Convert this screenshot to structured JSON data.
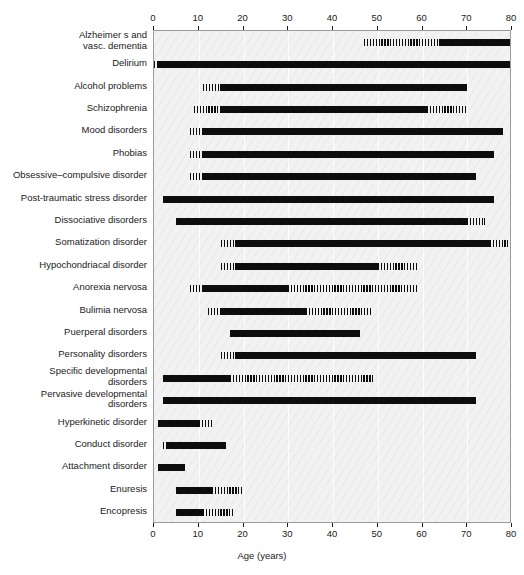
{
  "chart_data": {
    "type": "bar",
    "title": "",
    "xlabel": "Age (years)",
    "ylabel": "",
    "xlim": [
      0,
      80
    ],
    "xticks": [
      0,
      10,
      20,
      30,
      40,
      50,
      60,
      70,
      80
    ],
    "xticklabels": [
      "0",
      "10",
      "20",
      "30",
      "40",
      "50",
      "60",
      "70",
      "80"
    ],
    "grid": true,
    "legend": "none",
    "orientation": "horizontal",
    "note": "Each row shows an age range; solid black = peak/typical onset period, hatched (striped) = less typical onset period.",
    "categories": [
      "Alzheimer s and\nvasc. dementia",
      "Delirium",
      "Alcohol problems",
      "Schizophrenia",
      "Mood disorders",
      "Phobias",
      "Obsessive–compulsive disorder",
      "Post-traumatic stress disorder",
      "Dissociative disorders",
      "Somatization disorder",
      "Hypochondriacal disorder",
      "Anorexia nervosa",
      "Bulimia nervosa",
      "Puerperal disorders",
      "Personality disorders",
      "Specific developmental\ndisorders",
      "Pervasive developmental\ndisorders",
      "Hyperkinetic disorder",
      "Conduct disorder",
      "Attachment disorder",
      "Enuresis",
      "Encopresis"
    ],
    "rows": [
      {
        "label": "Alzheimer s and\nvasc. dementia",
        "two_line": true,
        "segments": [
          {
            "start": 47,
            "end": 64,
            "style": "hatch"
          },
          {
            "start": 64,
            "end": 80,
            "style": "solid"
          }
        ]
      },
      {
        "label": "Delirium",
        "two_line": false,
        "segments": [
          {
            "start": 0,
            "end": 1,
            "style": "hatch"
          },
          {
            "start": 1,
            "end": 80,
            "style": "solid"
          }
        ]
      },
      {
        "label": "Alcohol problems",
        "two_line": false,
        "segments": [
          {
            "start": 11,
            "end": 15,
            "style": "hatch"
          },
          {
            "start": 15,
            "end": 70,
            "style": "solid"
          }
        ]
      },
      {
        "label": "Schizophrenia",
        "two_line": false,
        "segments": [
          {
            "start": 9,
            "end": 15,
            "style": "hatch"
          },
          {
            "start": 15,
            "end": 61,
            "style": "solid"
          },
          {
            "start": 61,
            "end": 70,
            "style": "hatch"
          }
        ]
      },
      {
        "label": "Mood disorders",
        "two_line": false,
        "segments": [
          {
            "start": 8,
            "end": 11,
            "style": "hatch"
          },
          {
            "start": 11,
            "end": 78,
            "style": "solid"
          }
        ]
      },
      {
        "label": "Phobias",
        "two_line": false,
        "segments": [
          {
            "start": 8,
            "end": 11,
            "style": "hatch"
          },
          {
            "start": 11,
            "end": 76,
            "style": "solid"
          }
        ]
      },
      {
        "label": "Obsessive–compulsive disorder",
        "two_line": false,
        "segments": [
          {
            "start": 8,
            "end": 11,
            "style": "hatch"
          },
          {
            "start": 11,
            "end": 72,
            "style": "solid"
          }
        ]
      },
      {
        "label": "Post-traumatic stress disorder",
        "two_line": false,
        "segments": [
          {
            "start": 2,
            "end": 76,
            "style": "solid"
          }
        ]
      },
      {
        "label": "Dissociative disorders",
        "two_line": false,
        "segments": [
          {
            "start": 5,
            "end": 70,
            "style": "solid"
          },
          {
            "start": 70,
            "end": 74,
            "style": "hatch"
          }
        ]
      },
      {
        "label": "Somatization disorder",
        "two_line": false,
        "segments": [
          {
            "start": 15,
            "end": 18,
            "style": "hatch"
          },
          {
            "start": 18,
            "end": 75,
            "style": "solid"
          },
          {
            "start": 75,
            "end": 79,
            "style": "hatch"
          }
        ]
      },
      {
        "label": "Hypochondriacal disorder",
        "two_line": false,
        "segments": [
          {
            "start": 15,
            "end": 18,
            "style": "hatch"
          },
          {
            "start": 18,
            "end": 50,
            "style": "solid"
          },
          {
            "start": 50,
            "end": 59,
            "style": "hatch"
          }
        ]
      },
      {
        "label": "Anorexia nervosa",
        "two_line": false,
        "segments": [
          {
            "start": 8,
            "end": 11,
            "style": "hatch"
          },
          {
            "start": 11,
            "end": 30,
            "style": "solid"
          },
          {
            "start": 30,
            "end": 59,
            "style": "hatch"
          }
        ]
      },
      {
        "label": "Bulimia nervosa",
        "two_line": false,
        "segments": [
          {
            "start": 12,
            "end": 15,
            "style": "hatch"
          },
          {
            "start": 15,
            "end": 34,
            "style": "solid"
          },
          {
            "start": 34,
            "end": 49,
            "style": "hatch"
          }
        ]
      },
      {
        "label": "Puerperal disorders",
        "two_line": false,
        "segments": [
          {
            "start": 17,
            "end": 46,
            "style": "solid"
          }
        ]
      },
      {
        "label": "Personality disorders",
        "two_line": false,
        "segments": [
          {
            "start": 15,
            "end": 18,
            "style": "hatch"
          },
          {
            "start": 18,
            "end": 72,
            "style": "solid"
          }
        ]
      },
      {
        "label": "Specific developmental\ndisorders",
        "two_line": true,
        "segments": [
          {
            "start": 2,
            "end": 17,
            "style": "solid"
          },
          {
            "start": 17,
            "end": 49,
            "style": "hatch"
          }
        ]
      },
      {
        "label": "Pervasive developmental\ndisorders",
        "two_line": true,
        "segments": [
          {
            "start": 2,
            "end": 72,
            "style": "solid"
          }
        ]
      },
      {
        "label": "Hyperkinetic disorder",
        "two_line": false,
        "segments": [
          {
            "start": 1,
            "end": 10,
            "style": "solid"
          },
          {
            "start": 10,
            "end": 13,
            "style": "hatch"
          }
        ]
      },
      {
        "label": "Conduct disorder",
        "two_line": false,
        "segments": [
          {
            "start": 2,
            "end": 3,
            "style": "hatch"
          },
          {
            "start": 3,
            "end": 16,
            "style": "solid"
          }
        ]
      },
      {
        "label": "Attachment disorder",
        "two_line": false,
        "segments": [
          {
            "start": 1,
            "end": 7,
            "style": "solid"
          }
        ]
      },
      {
        "label": "Enuresis",
        "two_line": false,
        "segments": [
          {
            "start": 5,
            "end": 13,
            "style": "solid"
          },
          {
            "start": 13,
            "end": 20,
            "style": "hatch"
          }
        ]
      },
      {
        "label": "Encopresis",
        "two_line": false,
        "segments": [
          {
            "start": 5,
            "end": 11,
            "style": "solid"
          },
          {
            "start": 11,
            "end": 18,
            "style": "hatch"
          }
        ]
      }
    ]
  },
  "colors": {
    "plot_background": "#f2f2f2",
    "bar_solid": "#0d0d0d",
    "bar_hatch": "#0d0d0d",
    "gridline": "#ffffff",
    "axis": "#1a1a1a",
    "page_background": "#ffffff"
  }
}
